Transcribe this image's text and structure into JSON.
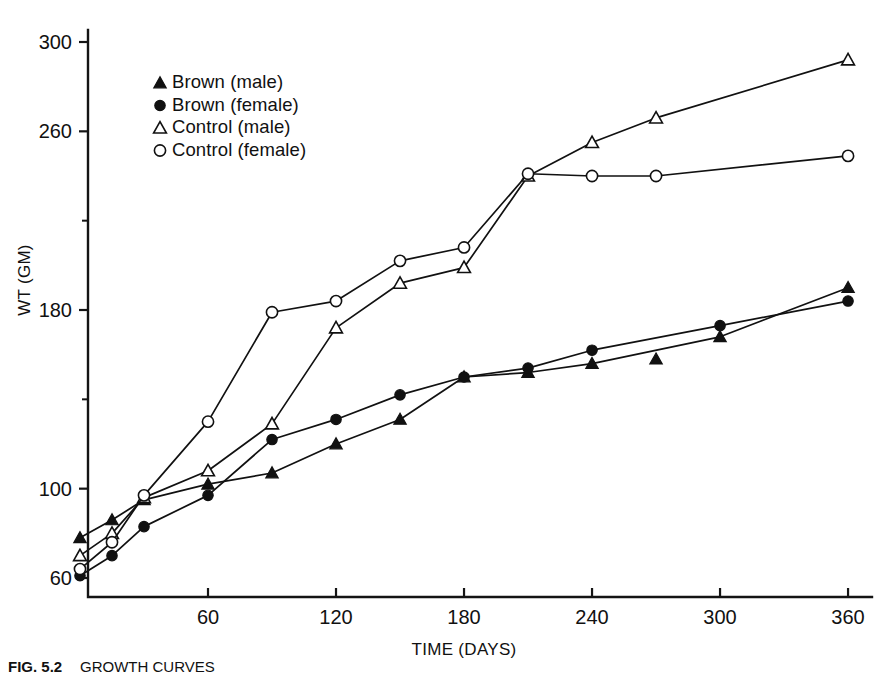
{
  "figure": {
    "caption_label": "FIG. 5.2",
    "caption_text": "GROWTH CURVES",
    "background_color": "#ffffff",
    "ink_color": "#111111"
  },
  "chart_data": {
    "type": "line",
    "title": "",
    "xlabel": "TIME (DAYS)",
    "ylabel": "WT (GM)",
    "xlim": [
      0,
      365
    ],
    "ylim": [
      50,
      310
    ],
    "grid": false,
    "legend_position": "top-left-inside",
    "x_ticks": [
      60,
      120,
      180,
      240,
      300,
      360
    ],
    "x_tick_labels": [
      "60",
      "120",
      "180",
      "240",
      "300",
      "360"
    ],
    "y_ticks": [
      60,
      100,
      180,
      260,
      300
    ],
    "y_tick_labels": [
      "60",
      "100",
      "180",
      "260",
      "300"
    ],
    "y_minor_ticks": [
      140,
      220
    ],
    "series": [
      {
        "name": "Brown (male)",
        "marker": "filled-triangle",
        "color": "#111111",
        "x": [
          0,
          15,
          30,
          60,
          90,
          120,
          150,
          180,
          210,
          240,
          300,
          360
        ],
        "y": [
          78,
          86,
          95,
          102,
          107,
          120,
          131,
          150,
          152,
          156,
          168,
          190
        ]
      },
      {
        "name": "Brown (female)",
        "marker": "filled-circle",
        "color": "#111111",
        "x": [
          0,
          15,
          30,
          60,
          90,
          120,
          150,
          180,
          210,
          240,
          300,
          360
        ],
        "y": [
          61,
          70,
          83,
          97,
          122,
          131,
          142,
          150,
          154,
          162,
          173,
          184
        ]
      },
      {
        "name": "Control (male)",
        "marker": "open-triangle",
        "color": "#111111",
        "x": [
          0,
          15,
          30,
          60,
          90,
          120,
          150,
          180,
          210,
          240,
          270,
          360
        ],
        "y": [
          70,
          80,
          96,
          108,
          129,
          172,
          192,
          199,
          240,
          255,
          266,
          292
        ]
      },
      {
        "name": "Control (female)",
        "marker": "open-circle",
        "color": "#111111",
        "x": [
          0,
          15,
          30,
          60,
          90,
          120,
          150,
          180,
          210,
          240,
          270,
          360
        ],
        "y": [
          64,
          76,
          97,
          130,
          179,
          184,
          202,
          208,
          241,
          240,
          240,
          249
        ]
      }
    ],
    "extra_points": [
      {
        "series": "Brown (male)",
        "marker": "filled-triangle",
        "x": 270,
        "y": 158,
        "note": "isolated marker below line"
      }
    ],
    "legend": [
      {
        "label": "Brown (male)",
        "marker": "filled-triangle"
      },
      {
        "label": "Brown (female)",
        "marker": "filled-circle"
      },
      {
        "label": "Control (male)",
        "marker": "open-triangle"
      },
      {
        "label": "Control (female)",
        "marker": "open-circle"
      }
    ]
  }
}
